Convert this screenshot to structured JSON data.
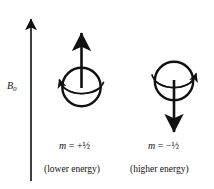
{
  "figure": {
    "name": "nuclear-spin-states-in-magnetic-field",
    "background_color": "#ffffff",
    "stroke_color": "#111111",
    "width": 214,
    "height": 189
  },
  "field_axis": {
    "label_symbol": "B",
    "label_subscript": "0",
    "direction": "up",
    "description": "applied magnetic field axis arrow pointing up"
  },
  "states": [
    {
      "id": "alpha",
      "quantum_number_text": "m = +½",
      "quantum_number_symbol": "m",
      "quantum_number_relation": "=",
      "quantum_number_value": "+½",
      "caption": "(lower energy)",
      "moment_direction": "up",
      "precession": "counterclockwise"
    },
    {
      "id": "beta",
      "quantum_number_text": "m = −½",
      "quantum_number_symbol": "m",
      "quantum_number_relation": "=",
      "quantum_number_value": "−½",
      "caption": "(higher energy)",
      "moment_direction": "down",
      "precession": "clockwise"
    }
  ],
  "icons": {
    "field_arrow": "arrow-up-icon",
    "spin_up_arrow": "arrow-up-icon",
    "spin_down_arrow": "arrow-down-icon",
    "precession_left": "curved-arrow-icon",
    "precession_right": "curved-arrow-icon",
    "nucleus": "sphere-icon"
  }
}
